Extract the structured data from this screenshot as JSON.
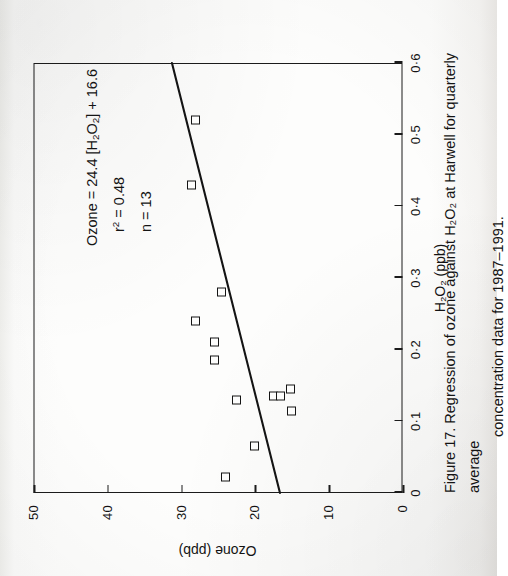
{
  "figure": {
    "caption_label": "Figure 17.",
    "caption_line1": "Regression of ozone against H₂O₂ at Harwell for quarterly average",
    "caption_line2": "concentration data for 1987–1991."
  },
  "annotation": {
    "equation": "Ozone = 24.4 [H₂O₂] + 16.6",
    "equation_lhs": "Ozone = 24.4 [H",
    "equation_sub1": "2",
    "equation_mid": "O",
    "equation_sub2": "2",
    "equation_rhs": "] + 16.6",
    "r2_label": "r",
    "r2_sup": "2",
    "r2_value": " = 0.48",
    "n_label": "n",
    "n_value": " = 13"
  },
  "colors": {
    "ink": "#141414",
    "paper": "#fcfcfb",
    "marker_fill": "#fdfdfc"
  },
  "chart_data": {
    "type": "scatter",
    "title": "",
    "xlabel": "H₂O₂ (ppb)",
    "ylabel": "Ozone (ppb)",
    "xlim": [
      0,
      0.6
    ],
    "ylim": [
      0,
      50
    ],
    "xticks": [
      0,
      0.1,
      0.2,
      0.3,
      0.4,
      0.5,
      0.6
    ],
    "xticklabels": [
      "0",
      "0·1",
      "0·2",
      "0·3",
      "0·4",
      "0·5",
      "0·6"
    ],
    "yticks": [
      0,
      10,
      20,
      30,
      40,
      50
    ],
    "yticklabels": [
      "0",
      "10",
      "20",
      "30",
      "40",
      "50"
    ],
    "grid": false,
    "legend": false,
    "n_points": 13,
    "points": [
      {
        "x": 0.022,
        "y": 24.0
      },
      {
        "x": 0.065,
        "y": 20.0
      },
      {
        "x": 0.115,
        "y": 15.0
      },
      {
        "x": 0.13,
        "y": 22.5
      },
      {
        "x": 0.135,
        "y": 17.5
      },
      {
        "x": 0.135,
        "y": 16.5
      },
      {
        "x": 0.145,
        "y": 15.2
      },
      {
        "x": 0.185,
        "y": 25.5
      },
      {
        "x": 0.21,
        "y": 25.5
      },
      {
        "x": 0.24,
        "y": 28.0
      },
      {
        "x": 0.28,
        "y": 24.5
      },
      {
        "x": 0.43,
        "y": 28.6
      },
      {
        "x": 0.52,
        "y": 28.0
      }
    ],
    "fit": {
      "type": "linear",
      "slope": 24.4,
      "intercept": 16.6,
      "r_squared": 0.48,
      "n": 13,
      "equation_text": "Ozone = 24.4 [H2O2] + 16.6",
      "x_start": 0.0,
      "x_end": 0.6
    }
  }
}
